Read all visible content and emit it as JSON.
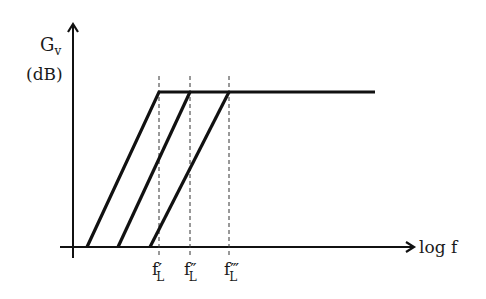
{
  "y_axis": {
    "label": "G",
    "label_sub": "v",
    "unit": "(dB)"
  },
  "x_axis": {
    "label": "log f"
  },
  "cutoffs": [
    {
      "name": "f",
      "prime": "′",
      "sub": "L"
    },
    {
      "name": "f",
      "prime": "″",
      "sub": "L"
    },
    {
      "name": "f",
      "prime": "‴",
      "sub": "L"
    }
  ],
  "colors": {
    "line": "#111111",
    "dash": "#333333"
  }
}
